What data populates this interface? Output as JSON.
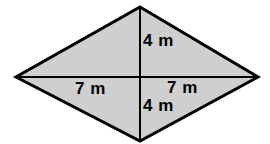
{
  "figure": {
    "name": "rhombus-with-diagonals",
    "shape_type": "rhombus",
    "unit": "m",
    "fill_color": "#cfcfcf",
    "outline_color": "#000000",
    "diagonal_color": "#000000",
    "background_color": "#ffffff",
    "outline_width": 3,
    "diagonal_width": 2,
    "vertices": {
      "top": {
        "x": 140,
        "y": 7
      },
      "right": {
        "x": 258,
        "y": 77
      },
      "bottom": {
        "x": 140,
        "y": 141
      },
      "left": {
        "x": 16,
        "y": 77
      }
    },
    "center": {
      "x": 140,
      "y": 77
    },
    "polygon_points": "140,7 258,77 140,141 16,77",
    "vertical_diagonal": {
      "x1": 140,
      "y1": 7,
      "x2": 140,
      "y2": 141
    },
    "horizontal_diagonal": {
      "x1": 16,
      "y1": 77,
      "x2": 258,
      "y2": 77
    }
  },
  "labels": {
    "top_vertical": "4 m",
    "bottom_vertical": "4 m",
    "left_horizontal": "7 m",
    "right_horizontal": "7 m"
  },
  "chart_data": {
    "type": "diagram",
    "title": "",
    "shape": "rhombus",
    "measurements": [
      {
        "segment": "upper half of vertical diagonal",
        "value": 4,
        "unit": "m",
        "label": "4 m"
      },
      {
        "segment": "lower half of vertical diagonal",
        "value": 4,
        "unit": "m",
        "label": "4 m"
      },
      {
        "segment": "left half of horizontal diagonal",
        "value": 7,
        "unit": "m",
        "label": "7 m"
      },
      {
        "segment": "right half of horizontal diagonal",
        "value": 7,
        "unit": "m",
        "label": "7 m"
      }
    ]
  }
}
